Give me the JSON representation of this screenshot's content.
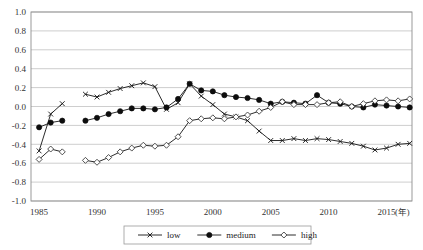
{
  "chart_data": {
    "type": "line",
    "title": "",
    "xlabel": "(年)",
    "ylabel": "",
    "ylim": [
      -1.0,
      1.0
    ],
    "xlim": [
      1984.3,
      1917.0
    ],
    "x_range": [
      1984.3,
      2017.2
    ],
    "grid": true,
    "legend_position": "bottom",
    "ytick_labels": [
      "1.0",
      "0.8",
      "0.6",
      "0.4",
      "0.2",
      "0.0",
      "-0.2",
      "-0.4",
      "-0.6",
      "-0.8",
      "-1.0"
    ],
    "ytick_values": [
      1.0,
      0.8,
      0.6,
      0.4,
      0.2,
      0.0,
      -0.2,
      -0.4,
      -0.6,
      -0.8,
      -1.0
    ],
    "xtick_labels": [
      "1985",
      "1990",
      "1995",
      "2000",
      "2005",
      "2010",
      "2015"
    ],
    "xtick_values": [
      1985,
      1990,
      1995,
      2000,
      2005,
      2010,
      2015
    ],
    "series": [
      {
        "name": "low",
        "marker": "cross",
        "segments": [
          {
            "x": [
              1985,
              1986,
              1987
            ],
            "values": [
              -0.47,
              -0.08,
              0.03
            ]
          },
          {
            "x": [
              1989,
              1990,
              1991,
              1992,
              1993,
              1994,
              1995,
              1996,
              1997,
              1998,
              1999,
              2000,
              2001,
              2002,
              2003,
              2004,
              2005,
              2006,
              2007,
              2008,
              2009,
              2010,
              2011,
              2012,
              2013,
              2014,
              2015,
              2016,
              2017
            ],
            "values": [
              0.13,
              0.1,
              0.15,
              0.19,
              0.22,
              0.25,
              0.21,
              -0.03,
              0.04,
              0.24,
              0.11,
              0.02,
              -0.08,
              -0.11,
              -0.15,
              -0.26,
              -0.36,
              -0.36,
              -0.34,
              -0.36,
              -0.34,
              -0.35,
              -0.37,
              -0.39,
              -0.42,
              -0.46,
              -0.44,
              -0.4,
              -0.39
            ]
          }
        ]
      },
      {
        "name": "medium",
        "marker": "dot",
        "segments": [
          {
            "x": [
              1985,
              1986,
              1987
            ],
            "values": [
              -0.22,
              -0.17,
              -0.15
            ]
          },
          {
            "x": [
              1989,
              1990,
              1991,
              1992,
              1993,
              1994,
              1995,
              1996,
              1997,
              1998,
              1999,
              2000,
              2001,
              2002,
              2003,
              2004,
              2005,
              2006,
              2007,
              2008,
              2009,
              2010,
              2011,
              2012,
              2013,
              2014,
              2015,
              2016,
              2017
            ],
            "values": [
              -0.15,
              -0.12,
              -0.08,
              -0.05,
              -0.02,
              -0.02,
              -0.03,
              -0.01,
              0.08,
              0.24,
              0.17,
              0.16,
              0.12,
              0.1,
              0.09,
              0.07,
              0.03,
              0.05,
              0.04,
              0.03,
              0.12,
              0.04,
              0.03,
              0.0,
              -0.01,
              0.02,
              0.01,
              0.0,
              -0.01
            ]
          }
        ]
      },
      {
        "name": "high",
        "marker": "diamond",
        "segments": [
          {
            "x": [
              1985,
              1986,
              1987
            ],
            "values": [
              -0.56,
              -0.45,
              -0.48
            ]
          },
          {
            "x": [
              1989,
              1990,
              1991,
              1992,
              1993,
              1994,
              1995,
              1996,
              1997,
              1998,
              1999,
              2000,
              2001,
              2002,
              2003,
              2004,
              2005,
              2006,
              2007,
              2008,
              2009,
              2010,
              2011,
              2012,
              2013,
              2014,
              2015,
              2016,
              2017
            ],
            "values": [
              -0.57,
              -0.59,
              -0.54,
              -0.48,
              -0.44,
              -0.41,
              -0.42,
              -0.41,
              -0.32,
              -0.15,
              -0.13,
              -0.12,
              -0.13,
              -0.11,
              -0.09,
              -0.05,
              -0.01,
              0.05,
              0.02,
              0.02,
              0.02,
              0.04,
              0.05,
              0.0,
              0.03,
              0.06,
              0.07,
              0.06,
              0.08
            ]
          }
        ]
      }
    ]
  },
  "legend": {
    "entries": [
      {
        "label": "low",
        "marker": "cross"
      },
      {
        "label": "medium",
        "marker": "dot"
      },
      {
        "label": "high",
        "marker": "diamond"
      }
    ]
  }
}
